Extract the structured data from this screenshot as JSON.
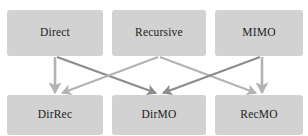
{
  "diagram": {
    "type": "flow-diagram",
    "canvas": {
      "width": 308,
      "height": 136,
      "background": "#ffffff"
    },
    "node_style": {
      "fill": "#d2d2d2",
      "text_color": "#1c1c1c",
      "corner_radius": 3
    },
    "nodes": [
      {
        "id": "direct",
        "label": "Direct",
        "row": "top",
        "x": 7,
        "y": 10,
        "w": 96,
        "h": 46
      },
      {
        "id": "recursive",
        "label": "Recursive",
        "row": "top",
        "x": 112,
        "y": 10,
        "w": 94,
        "h": 46
      },
      {
        "id": "mimo",
        "label": "MIMO",
        "row": "top",
        "x": 215,
        "y": 10,
        "w": 88,
        "h": 46
      },
      {
        "id": "dirrec",
        "label": "DirRec",
        "row": "bottom",
        "x": 7,
        "y": 95,
        "w": 96,
        "h": 40
      },
      {
        "id": "dirmo",
        "label": "DirMO",
        "row": "bottom",
        "x": 112,
        "y": 95,
        "w": 94,
        "h": 40
      },
      {
        "id": "recmo",
        "label": "RecMO",
        "row": "bottom",
        "x": 215,
        "y": 95,
        "w": 88,
        "h": 40
      }
    ],
    "edges": [
      {
        "id": "direct-to-dirrec",
        "from": "Direct",
        "to": "DirRec",
        "color": "#b3b3b3",
        "x1": 55,
        "y1": 57,
        "x2": 55,
        "y2": 93
      },
      {
        "id": "direct-to-dirmo",
        "from": "Direct",
        "to": "DirMO",
        "color": "#8c8c8c",
        "x1": 57,
        "y1": 57,
        "x2": 156,
        "y2": 93
      },
      {
        "id": "recursive-to-dirrec",
        "from": "Recursive",
        "to": "DirRec",
        "color": "#b3b3b3",
        "x1": 158,
        "y1": 57,
        "x2": 62,
        "y2": 93
      },
      {
        "id": "recursive-to-recmo",
        "from": "Recursive",
        "to": "RecMO",
        "color": "#b3b3b3",
        "x1": 160,
        "y1": 57,
        "x2": 256,
        "y2": 93
      },
      {
        "id": "mimo-to-dirmo",
        "from": "MIMO",
        "to": "DirMO",
        "color": "#8c8c8c",
        "x1": 260,
        "y1": 57,
        "x2": 163,
        "y2": 93
      },
      {
        "id": "mimo-to-recmo",
        "from": "MIMO",
        "to": "RecMO",
        "color": "#b3b3b3",
        "x1": 262,
        "y1": 57,
        "x2": 262,
        "y2": 93
      }
    ]
  }
}
